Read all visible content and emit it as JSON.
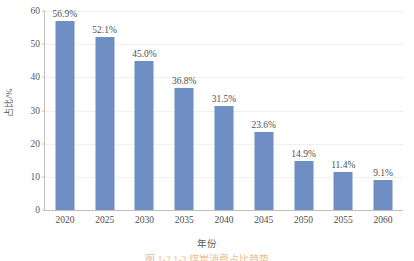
{
  "chart_data": {
    "type": "bar",
    "title": "",
    "xlabel": "年份",
    "ylabel": "占比/%",
    "categories": [
      "2020",
      "2025",
      "2030",
      "2035",
      "2040",
      "2045",
      "2050",
      "2055",
      "2060"
    ],
    "values": [
      56.9,
      52.1,
      45.0,
      36.8,
      31.5,
      23.6,
      14.9,
      11.4,
      9.1
    ],
    "value_labels": [
      "56.9%",
      "52.1%",
      "45.0%",
      "36.8%",
      "31.5%",
      "23.6%",
      "14.9%",
      "11.4%",
      "9.1%"
    ],
    "ylim": [
      0,
      60
    ],
    "yticks": [
      0,
      10,
      20,
      30,
      40,
      50,
      60
    ],
    "ytick_labels": [
      "0",
      "10",
      "20",
      "30",
      "40",
      "50",
      "60"
    ],
    "grid": true,
    "grid_axis": "y",
    "legend": false,
    "bar_color": "#6f8fc4",
    "axis_color": "#bfbfbf",
    "gridline_color": "#f0f0f0",
    "text_color": "#4f4f4f"
  },
  "caption": {
    "text": "图 1-2  1-3  煤炭消费占比趋势"
  }
}
